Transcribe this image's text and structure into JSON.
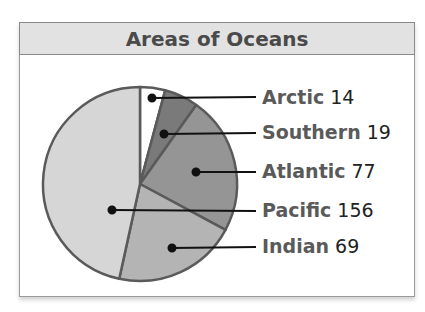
{
  "chart_data": {
    "type": "pie",
    "title": "Areas of Oceans",
    "categories": [
      "Arctic",
      "Southern",
      "Atlantic",
      "Indian",
      "Pacific"
    ],
    "values": [
      14,
      19,
      77,
      69,
      156
    ],
    "colors": [
      "#ffffff",
      "#7a7a7a",
      "#959595",
      "#b4b4b4",
      "#d6d6d6"
    ],
    "labels": [
      {
        "name": "Arctic",
        "value": "14"
      },
      {
        "name": "Southern",
        "value": "19"
      },
      {
        "name": "Atlantic",
        "value": "77"
      },
      {
        "name": "Pacific",
        "value": "156"
      },
      {
        "name": "Indian",
        "value": "69"
      }
    ],
    "start_angle_deg": 0,
    "direction": "clockwise",
    "legend_position": "right"
  }
}
